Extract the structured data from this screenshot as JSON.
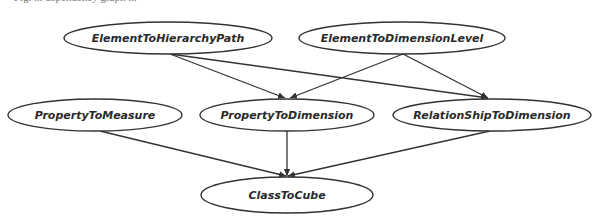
{
  "caption_clipped": "Fig. ... dependency graph ... ",
  "colors": {
    "stroke": "#333333",
    "text": "#2a2a2a",
    "background": "#ffffff"
  },
  "nodes": [
    {
      "id": "e2hp",
      "label": "ElementToHierarchyPath",
      "cx": 168,
      "cy": 38,
      "rx": 104,
      "ry": 16
    },
    {
      "id": "e2dl",
      "label": "ElementToDimensionLevel",
      "cx": 402,
      "cy": 38,
      "rx": 103,
      "ry": 16
    },
    {
      "id": "p2m",
      "label": "PropertyToMeasure",
      "cx": 95,
      "cy": 115,
      "rx": 87,
      "ry": 16
    },
    {
      "id": "p2d",
      "label": "PropertyToDimension",
      "cx": 287,
      "cy": 115,
      "rx": 87,
      "ry": 16
    },
    {
      "id": "r2d",
      "label": "RelationShipToDimension",
      "cx": 492,
      "cy": 115,
      "rx": 99,
      "ry": 16
    },
    {
      "id": "c2c",
      "label": "ClassToCube",
      "cx": 287,
      "cy": 195,
      "rx": 86,
      "ry": 18
    }
  ],
  "edges": [
    {
      "from": "e2hp",
      "to": "p2d",
      "x1": 170,
      "y1": 54,
      "x2": 285,
      "y2": 98
    },
    {
      "from": "e2hp",
      "to": "r2d",
      "x1": 170,
      "y1": 54,
      "x2": 488,
      "y2": 98
    },
    {
      "from": "e2dl",
      "to": "p2d",
      "x1": 403,
      "y1": 54,
      "x2": 290,
      "y2": 98
    },
    {
      "from": "e2dl",
      "to": "r2d",
      "x1": 403,
      "y1": 54,
      "x2": 488,
      "y2": 98
    },
    {
      "from": "p2m",
      "to": "c2c",
      "x1": 100,
      "y1": 131,
      "x2": 286,
      "y2": 176
    },
    {
      "from": "p2d",
      "to": "c2c",
      "x1": 287,
      "y1": 131,
      "x2": 287,
      "y2": 176
    },
    {
      "from": "r2d",
      "to": "c2c",
      "x1": 490,
      "y1": 131,
      "x2": 288,
      "y2": 176
    }
  ]
}
